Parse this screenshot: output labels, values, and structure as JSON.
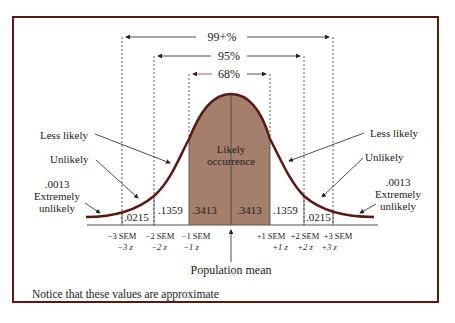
{
  "diagram": {
    "type": "normal-distribution",
    "ranges": [
      {
        "label": "99+%",
        "from": "-3 SEM",
        "to": "+3 SEM"
      },
      {
        "label": "95%",
        "from": "-2 SEM",
        "to": "+2 SEM"
      },
      {
        "label": "68%",
        "from": "-1 SEM",
        "to": "+1 SEM"
      }
    ],
    "areas": [
      ".0215",
      ".1359",
      ".3413",
      ".3413",
      ".1359",
      ".0215"
    ],
    "center_label_line1": "Likely",
    "center_label_line2": "occurrence",
    "left": {
      "less_likely": "Less likely",
      "unlikely": "Unlikely",
      "tail_value": ".0013",
      "tail_line1": "Extremely",
      "tail_line2": "unlikely"
    },
    "right": {
      "less_likely": "Less likely",
      "unlikely": "Unlikely",
      "tail_value": ".0013",
      "tail_line1": "Extremely",
      "tail_line2": "unlikely"
    },
    "axis": {
      "sem": [
        "−3 SEM",
        "−2 SEM",
        "−1 SEM",
        "+1 SEM",
        "+2 SEM",
        "+3 SEM"
      ],
      "z": [
        "−3 z",
        "−2 z",
        "−1 z",
        "+1 z",
        "+2 z",
        "+3 z"
      ]
    },
    "mean_label": "Population mean",
    "footnote": "Notice that these values are approximate",
    "colors": {
      "frame": "#5a1a14",
      "curve": "#5a1a14",
      "shade": "#a47f6c"
    }
  }
}
